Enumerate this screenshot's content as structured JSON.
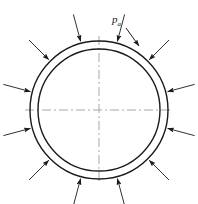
{
  "figure": {
    "background_color": "#ffffff",
    "line_color": "#1a1a1a",
    "centerline_color": "#a8a8a8",
    "width": 198,
    "height": 204
  },
  "ring": {
    "center_x": 99,
    "center_y": 110,
    "outer_radius": 69,
    "inner_radius": 61,
    "stroke_width": 1.4
  },
  "centerlines": {
    "style": "dash-dot",
    "horizontal_label": "horizontal-centerline",
    "vertical_label": "vertical-centerline",
    "half_length": 74,
    "dash_pattern": "9 3 2 3"
  },
  "label": {
    "symbol": "p",
    "subscript": "a",
    "full_text": "pa",
    "x": 112,
    "y": 14
  },
  "leader": {
    "name": "pressure-leader-line",
    "from_x": 126,
    "from_y": 28,
    "to_x": 139,
    "to_y": 46
  },
  "arrows": {
    "count": 12,
    "direction": "inward",
    "description": "Uniform external pressure arrows pointing radially inward toward the outer circle",
    "tail_radius": 99,
    "head_radius": 71,
    "angles_deg": [
      255,
      285,
      315,
      345,
      15,
      45,
      75,
      105,
      135,
      165,
      195,
      225
    ]
  },
  "chart_data": {
    "type": "diagram",
    "annotations": [
      "pa"
    ],
    "elements": [
      {
        "name": "outer-circle",
        "shape": "circle",
        "cx": 99,
        "cy": 110,
        "r": 69
      },
      {
        "name": "inner-circle",
        "shape": "circle",
        "cx": 99,
        "cy": 110,
        "r": 61
      },
      {
        "name": "horizontal-centerline",
        "shape": "line",
        "x1": 25,
        "y1": 110,
        "x2": 173,
        "y2": 110
      },
      {
        "name": "vertical-centerline",
        "shape": "line",
        "x1": 99,
        "y1": 36,
        "x2": 99,
        "y2": 184
      },
      {
        "name": "pressure-arrows",
        "shape": "arrow-set",
        "count": 12,
        "direction": "inward"
      }
    ]
  }
}
